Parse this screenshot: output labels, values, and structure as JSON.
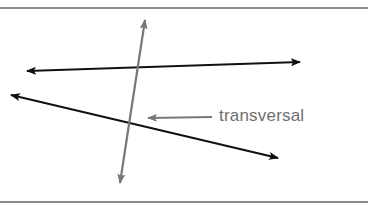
{
  "diagram": {
    "label": "transversal",
    "colors": {
      "parallel_lines": "#111111",
      "transversal": "#777777",
      "label_text": "#6e6e6e",
      "rules": "#8a8a8a"
    },
    "lines": [
      {
        "name": "line-1",
        "from": [
          27,
          71
        ],
        "to": [
          300,
          62
        ],
        "arrows": "both"
      },
      {
        "name": "line-2",
        "from": [
          11,
          95
        ],
        "to": [
          278,
          158
        ],
        "arrows": "both"
      },
      {
        "name": "transversal",
        "from": [
          120,
          183
        ],
        "to": [
          145,
          20
        ],
        "arrows": "both"
      }
    ],
    "label_arrow": {
      "from": [
        212,
        117
      ],
      "to": [
        147,
        118
      ]
    }
  }
}
